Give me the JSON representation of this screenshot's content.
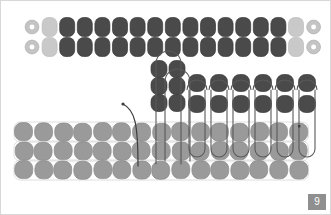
{
  "slide": {
    "page_number": "9",
    "background_color": "#ffffff",
    "border_color": "#d8d8d8",
    "badge_color": "#8f8f8f",
    "badge_text_color": "#ffffff"
  },
  "palette": {
    "dark_unit": "#4a4a4a",
    "dark_unit_stroke": "#3a3a3a",
    "mid_unit": "#9a9a9a",
    "mid_unit_stroke": "#8a8a8a",
    "light_unit": "#c9c9c9",
    "light_unit_stroke": "#bdbdbd",
    "ring_fill": "#c4c4c4",
    "ring_hole": "#ffffff",
    "ring_stroke": "#b5b5b5",
    "path_stroke": "#3d3d3d",
    "loop_outline": "#5a5a5a",
    "faint_outline": "#d5d5d5"
  },
  "diagram": {
    "bands": [
      {
        "name": "top-band",
        "rows": 2,
        "y_positions": [
          26,
          46
        ],
        "x_start": 31,
        "x_step": 17.6,
        "unit_w": 15,
        "unit_h": 19,
        "sequence": [
          "ring",
          "light",
          "dark",
          "dark",
          "dark",
          "dark",
          "dark",
          "dark",
          "dark",
          "dark",
          "dark",
          "dark",
          "dark",
          "dark",
          "dark",
          "light",
          "ring"
        ]
      },
      {
        "name": "center-dark-column",
        "rows": 3,
        "y_positions": [
          68,
          85,
          102
        ],
        "x_positions": [
          158,
          176
        ],
        "unit_w": 16,
        "unit_h": 17,
        "fill": "dark"
      },
      {
        "name": "right-dark-band",
        "rows": 3,
        "y_positions": [
          82,
          99,
          112
        ],
        "x_start": 196,
        "x_step": 22,
        "count": 6,
        "unit_w": 17,
        "unit_h": 17,
        "fill": "dark"
      },
      {
        "name": "bottom-band",
        "rows": 3,
        "y_positions": [
          131,
          150,
          169
        ],
        "x_start": 23,
        "x_step": 19.6,
        "count": 15,
        "unit_w": 18,
        "unit_h": 18,
        "fill": "mid"
      }
    ],
    "loops": {
      "center_tall_loop": {
        "x_left": 155,
        "x_right": 180,
        "y_top": 50,
        "y_bottom": 163,
        "radius": 10
      },
      "right_loop_count": 6,
      "right_loop_y_top": 89,
      "right_loop_y_bottom": 156,
      "right_loop_width": 20
    },
    "thread_tail": {
      "start_x": 122,
      "start_y": 103,
      "end_x": 137,
      "end_y": 165,
      "marker": "dot"
    }
  }
}
